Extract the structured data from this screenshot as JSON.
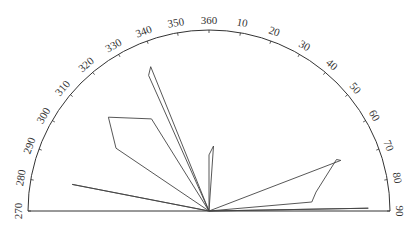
{
  "chart_data": {
    "type": "rose",
    "title": "",
    "range_degrees": [
      270,
      90
    ],
    "tick_labels": [
      "270",
      "280",
      "290",
      "300",
      "310",
      "320",
      "330",
      "340",
      "350",
      "360",
      "10",
      "20",
      "30",
      "40",
      "50",
      "60",
      "70",
      "80",
      "90"
    ],
    "tick_angles": [
      270,
      280,
      290,
      300,
      310,
      320,
      330,
      340,
      350,
      360,
      10,
      20,
      30,
      40,
      50,
      60,
      70,
      80,
      90
    ],
    "petals": [
      {
        "name": "petal-281",
        "points": [
          [
            281,
            0.77
          ]
        ]
      },
      {
        "name": "petal-300-325",
        "points": [
          [
            304,
            0.62
          ],
          [
            313,
            0.76
          ],
          [
            328,
            0.6
          ]
        ]
      },
      {
        "name": "petal-338",
        "points": [
          [
            336,
            0.82
          ],
          [
            338,
            0.86
          ]
        ]
      },
      {
        "name": "petal-004",
        "points": [
          [
            0,
            0.31
          ],
          [
            4,
            0.36
          ]
        ]
      },
      {
        "name": "petal-065-080",
        "points": [
          [
            69,
            0.78
          ],
          [
            68,
            0.76
          ],
          [
            80,
            0.6
          ],
          [
            85,
            0.57
          ]
        ]
      },
      {
        "name": "petal-089",
        "points": [
          [
            89,
            0.88
          ]
        ]
      }
    ],
    "center_px": [
      209,
      211
    ],
    "radius_px": 181
  },
  "colors": {
    "stroke": "#444444",
    "background": "#ffffff"
  }
}
